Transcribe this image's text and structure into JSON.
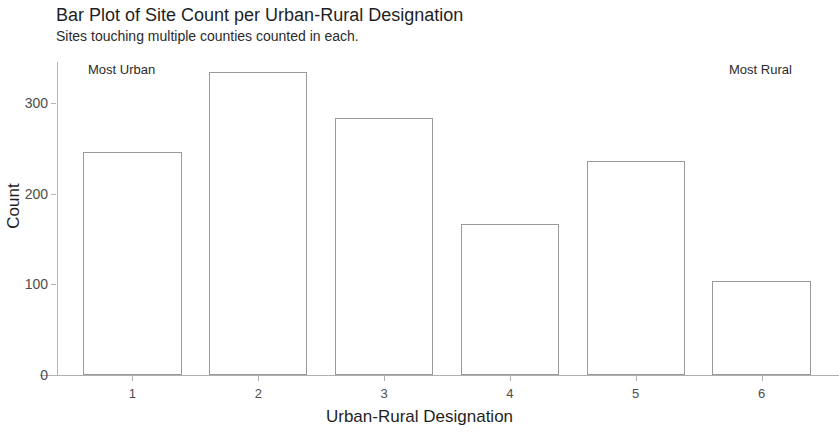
{
  "chart_data": {
    "type": "bar",
    "title": "Bar Plot of Site Count per Urban-Rural Designation",
    "subtitle": "Sites touching multiple counties counted in each.",
    "xlabel": "Urban-Rural Designation",
    "ylabel": "Count",
    "categories": [
      "1",
      "2",
      "3",
      "4",
      "5",
      "6"
    ],
    "values": [
      246,
      334,
      283,
      166,
      236,
      104
    ],
    "ylim": [
      0,
      345
    ],
    "xlim": [
      0.4,
      6.6
    ],
    "y_ticks": [
      0,
      100,
      200,
      300
    ],
    "y_tick_labels": [
      "0",
      "100",
      "200",
      "300"
    ],
    "x_ticks": [
      1,
      2,
      3,
      4,
      5,
      6
    ],
    "x_tick_labels": [
      "1",
      "2",
      "3",
      "4",
      "5",
      "6"
    ],
    "grid": false,
    "legend": null,
    "bar_fill": "#ffffff",
    "bar_stroke": "#9a9a9a",
    "axis_color": "#b0b0b0",
    "background": "#ffffff",
    "annotations": [
      {
        "text": "Most Urban",
        "x": 1,
        "position": "top-left"
      },
      {
        "text": "Most Rural",
        "x": 6,
        "position": "top-right"
      }
    ]
  }
}
